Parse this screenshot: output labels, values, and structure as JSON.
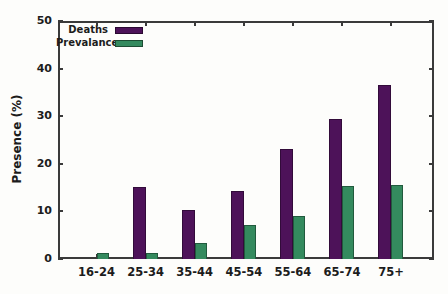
{
  "figure": {
    "background": "#fdfdfb",
    "border_color": "#3a3a3a",
    "text_color": "#1c1c1c"
  },
  "chart_data": {
    "type": "bar",
    "title": "",
    "xlabel": "",
    "ylabel": "Presence (%)",
    "categories": [
      "16-24",
      "25-34",
      "35-44",
      "45-54",
      "55-64",
      "65-74",
      "75+"
    ],
    "series": [
      {
        "name": "Deaths",
        "color": "#4d1259",
        "values": [
          0,
          15.2,
          10.2,
          14.2,
          23.2,
          29.4,
          36.6
        ]
      },
      {
        "name": "Prevalance",
        "color": "#348a5e",
        "values": [
          1.3,
          1.2,
          3.3,
          7.1,
          9.0,
          15.4,
          15.6
        ]
      }
    ],
    "ylim": [
      0,
      50
    ],
    "yticks": [
      0,
      10,
      20,
      30,
      40,
      50
    ],
    "grid": false,
    "legend_position": "top-left-inside",
    "tick_style": "inward-mirrored-on-all-borders"
  }
}
